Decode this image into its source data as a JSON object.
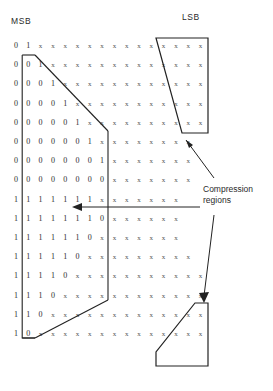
{
  "labels": {
    "msb": "MSB",
    "lsb": "LSB",
    "compression_line1": "Compression",
    "compression_line2": "regions"
  },
  "colors": {
    "ink": "#1a1a1a",
    "cell": "#3a3a3a",
    "outline": "#222222",
    "background": "#ffffff"
  },
  "grid": {
    "columns": 16,
    "rows": 17,
    "cell_width": 12.3,
    "cell_height": 19.2,
    "origin_x": 10,
    "origin_y": 40,
    "rows_data": [
      [
        "0",
        "1",
        "x",
        "x",
        "x",
        "x",
        "x",
        "x",
        "x",
        "x",
        "x",
        "x",
        "x",
        "x",
        "x",
        "x"
      ],
      [
        "0",
        "0",
        "1",
        "x",
        "x",
        "x",
        "x",
        "x",
        "x",
        "x",
        "x",
        "x",
        "x",
        "x",
        "x",
        "x"
      ],
      [
        "0",
        "0",
        "0",
        "1",
        "x",
        "x",
        "x",
        "x",
        "x",
        "x",
        "x",
        "x",
        "x",
        "x",
        "x",
        "x"
      ],
      [
        "0",
        "0",
        "0",
        "0",
        "1",
        "x",
        "x",
        "x",
        "x",
        "x",
        "x",
        "x",
        "x",
        "x",
        "x",
        "x"
      ],
      [
        "0",
        "0",
        "0",
        "0",
        "0",
        "1",
        "x",
        "x",
        "x",
        "x",
        "x",
        "x",
        "x",
        "x",
        "x",
        "x"
      ],
      [
        "0",
        "0",
        "0",
        "0",
        "0",
        "0",
        "1",
        "x",
        "x",
        "x",
        "x",
        "x",
        "x",
        "x",
        "x",
        ""
      ],
      [
        "0",
        "0",
        "0",
        "0",
        "0",
        "0",
        "0",
        "1",
        "x",
        "x",
        "x",
        "x",
        "x",
        "x",
        "x",
        ""
      ],
      [
        "0",
        "0",
        "0",
        "0",
        "0",
        "0",
        "0",
        "0",
        "x",
        "x",
        "x",
        "x",
        "x",
        "x",
        "x",
        ""
      ],
      [
        "1",
        "1",
        "1",
        "1",
        "1",
        "1",
        "1",
        "x",
        "x",
        "x",
        "x",
        "x",
        "x",
        "x",
        "",
        ""
      ],
      [
        "1",
        "1",
        "1",
        "1",
        "1",
        "1",
        "1",
        "0",
        "x",
        "x",
        "x",
        "x",
        "x",
        "x",
        "",
        ""
      ],
      [
        "1",
        "1",
        "1",
        "1",
        "1",
        "1",
        "0",
        "x",
        "x",
        "x",
        "x",
        "x",
        "x",
        "x",
        "",
        ""
      ],
      [
        "1",
        "1",
        "1",
        "1",
        "1",
        "0",
        "x",
        "x",
        "x",
        "x",
        "x",
        "x",
        "x",
        "x",
        "x",
        ""
      ],
      [
        "1",
        "1",
        "1",
        "1",
        "0",
        "x",
        "x",
        "x",
        "x",
        "x",
        "x",
        "x",
        "x",
        "x",
        "x",
        "x"
      ],
      [
        "1",
        "1",
        "1",
        "0",
        "x",
        "x",
        "x",
        "x",
        "x",
        "x",
        "x",
        "x",
        "x",
        "x",
        "x",
        "x"
      ],
      [
        "1",
        "1",
        "0",
        "x",
        "x",
        "x",
        "x",
        "x",
        "x",
        "x",
        "x",
        "x",
        "x",
        "x",
        "x",
        "x"
      ],
      [
        "1",
        "0",
        "x",
        "x",
        "x",
        "x",
        "x",
        "x",
        "x",
        "x",
        "x",
        "x",
        "x",
        "x",
        "x",
        "x"
      ]
    ]
  },
  "annotations": {
    "region_top_right": "top-right-compression-region",
    "region_bottom_right": "bottom-right-compression-region",
    "region_left": "left-sign-extension-region",
    "arrow_to_top_right": "arrow-pointing-to-top-right-region",
    "arrow_to_left": "arrow-pointing-to-left-region",
    "arrow_to_bottom_right": "arrow-pointing-to-bottom-right-region"
  }
}
